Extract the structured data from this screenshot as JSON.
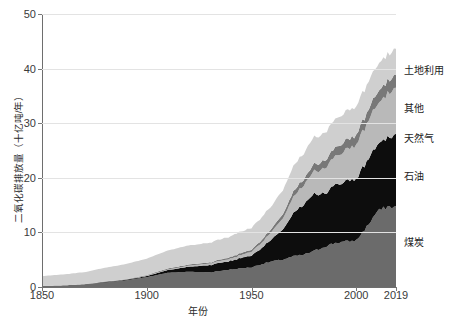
{
  "chart_data": {
    "type": "area",
    "stacked": true,
    "title": "",
    "xlabel": "年份",
    "ylabel": "二氧化碳排放量（十亿吨/年）",
    "xlim": [
      1850,
      2019
    ],
    "ylim": [
      0,
      50
    ],
    "xticks": [
      1850,
      1900,
      1950,
      2000,
      2019
    ],
    "yticks": [
      0,
      10,
      20,
      30,
      40,
      50
    ],
    "grid": true,
    "legend_position": "right-inline",
    "colors": {
      "coal": "#6b6b6b",
      "oil": "#0d0d0d",
      "gas": "#b9b9b9",
      "other": "#787878",
      "land_use": "#cfcfcf",
      "gridline": "#e3e3e3",
      "axis": "#6e6e6e",
      "text": "#2b2b2b",
      "background": "#ffffff"
    },
    "x": [
      1850,
      1860,
      1870,
      1880,
      1890,
      1900,
      1910,
      1920,
      1930,
      1940,
      1950,
      1955,
      1960,
      1965,
      1970,
      1975,
      1980,
      1985,
      1990,
      1995,
      2000,
      2005,
      2010,
      2015,
      2019
    ],
    "series": [
      {
        "name": "煤炭",
        "key": "coal",
        "values": [
          0.2,
          0.3,
          0.5,
          0.8,
          1.2,
          1.8,
          2.6,
          2.8,
          2.7,
          3.2,
          3.6,
          4.2,
          4.7,
          5.0,
          5.6,
          5.9,
          6.6,
          7.4,
          8.1,
          8.3,
          8.5,
          11.0,
          13.8,
          14.7,
          14.6
        ]
      },
      {
        "name": "石油",
        "key": "oil",
        "values": [
          0.0,
          0.0,
          0.0,
          0.1,
          0.1,
          0.2,
          0.5,
          0.9,
          1.3,
          1.6,
          2.2,
          3.0,
          4.1,
          5.6,
          8.0,
          9.0,
          10.4,
          9.8,
          10.6,
          11.0,
          11.4,
          12.0,
          12.3,
          12.6,
          12.9
        ]
      },
      {
        "name": "天然气",
        "key": "gas",
        "values": [
          0.0,
          0.0,
          0.0,
          0.0,
          0.0,
          0.1,
          0.1,
          0.2,
          0.3,
          0.4,
          0.7,
          1.0,
          1.4,
          2.0,
          3.0,
          3.5,
          4.2,
          4.6,
          5.3,
          5.8,
          6.2,
          6.8,
          7.5,
          8.0,
          8.5
        ]
      },
      {
        "name": "其他",
        "key": "other",
        "values": [
          0.0,
          0.0,
          0.0,
          0.1,
          0.1,
          0.1,
          0.2,
          0.2,
          0.2,
          0.3,
          0.4,
          0.5,
          0.6,
          0.8,
          1.0,
          1.1,
          1.3,
          1.4,
          1.6,
          1.7,
          1.8,
          2.0,
          2.2,
          2.3,
          2.4
        ]
      },
      {
        "name": "土地利用",
        "key": "land_use",
        "values": [
          1.8,
          2.0,
          2.2,
          2.5,
          2.8,
          3.0,
          3.3,
          3.5,
          3.6,
          3.8,
          4.0,
          4.1,
          4.2,
          4.4,
          4.6,
          4.8,
          5.0,
          5.1,
          5.2,
          5.3,
          5.2,
          5.1,
          5.0,
          4.9,
          4.8
        ]
      }
    ],
    "annotations": [
      {
        "label": "土地利用",
        "y_value": 40.0
      },
      {
        "label": "其他",
        "y_value": 33.0
      },
      {
        "label": "天然气",
        "y_value": 27.5
      },
      {
        "label": "石油",
        "y_value": 20.5
      },
      {
        "label": "煤炭",
        "y_value": 8.5
      }
    ]
  }
}
